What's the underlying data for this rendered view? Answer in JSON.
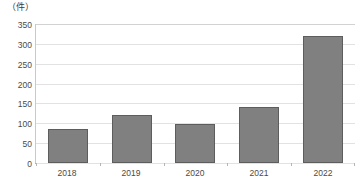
{
  "chart_data": {
    "type": "bar",
    "title": "",
    "subtitle": "",
    "xlabel": "",
    "ylabel": "（件）",
    "unit_label": "（件）",
    "categories": [
      "2018",
      "2019",
      "2020",
      "2021",
      "2022"
    ],
    "values": [
      85,
      122,
      99,
      141,
      321
    ],
    "series": [
      {
        "name": "件数",
        "values": [
          85,
          122,
          99,
          141,
          321
        ]
      }
    ],
    "ylim": [
      0,
      350
    ],
    "ytick_step": 50,
    "yticks": [
      "350",
      "300",
      "250",
      "200",
      "150",
      "100",
      "50",
      "0"
    ],
    "ytick_values": [
      350,
      300,
      250,
      200,
      150,
      100,
      50,
      0
    ],
    "grid": true,
    "grid_axis": "y",
    "legend": false,
    "legend_position": "none",
    "annotations": [],
    "colors": {
      "bar_fill": "#808080",
      "bar_border": "#5d5d5d",
      "gridline": "#e2e2e2",
      "axis": "#9a9a9a",
      "text": "#4a4a4a"
    }
  }
}
